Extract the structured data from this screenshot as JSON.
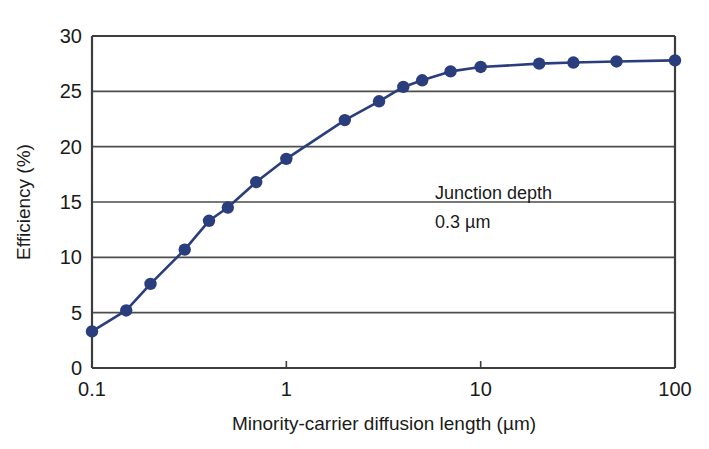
{
  "chart_data": {
    "type": "line",
    "title": "",
    "xlabel": "Minority-carrier diffusion length (µm)",
    "ylabel": "Efficiency (%)",
    "xscale": "log",
    "yscale": "linear",
    "xlim": [
      0.1,
      100
    ],
    "ylim": [
      0,
      30
    ],
    "xticks": [
      0.1,
      1,
      10,
      100
    ],
    "xtick_labels": [
      "0.1",
      "1",
      "10",
      "100"
    ],
    "yticks": [
      0,
      5,
      10,
      15,
      20,
      25,
      30
    ],
    "ytick_labels": [
      "0",
      "5",
      "10",
      "15",
      "20",
      "25",
      "30"
    ],
    "grid": "horizontal",
    "legend": "none",
    "series": [
      {
        "name": "Efficiency vs diffusion length",
        "color": "#2a3d7c",
        "marker": "circle",
        "x": [
          0.1,
          0.15,
          0.2,
          0.3,
          0.4,
          0.5,
          0.7,
          1.0,
          2.0,
          3.0,
          4.0,
          5.0,
          7.0,
          10.0,
          20.0,
          30.0,
          50.0,
          100.0
        ],
        "values": [
          3.3,
          5.2,
          7.6,
          10.7,
          13.3,
          14.5,
          16.8,
          18.9,
          22.4,
          24.1,
          25.4,
          26.0,
          26.8,
          27.2,
          27.5,
          27.6,
          27.7,
          27.8
        ]
      }
    ],
    "annotations": [
      {
        "id": "junction-depth",
        "line1": "Junction depth",
        "line2": "0.3 µm"
      }
    ]
  },
  "annotation": {
    "line1": "Junction depth",
    "line2": "0.3 µm"
  },
  "axes": {
    "x_title": "Minority-carrier diffusion length (µm)",
    "y_title": "Efficiency (%)",
    "x_labels": [
      "0.1",
      "1",
      "10",
      "100"
    ],
    "y_labels": [
      "0",
      "5",
      "10",
      "15",
      "20",
      "25",
      "30"
    ]
  },
  "colors": {
    "series": "#2a3d7c",
    "axis": "#3d3d3d",
    "grid": "#4d4d4d",
    "text": "#1a1a1a",
    "background": "#ffffff"
  }
}
